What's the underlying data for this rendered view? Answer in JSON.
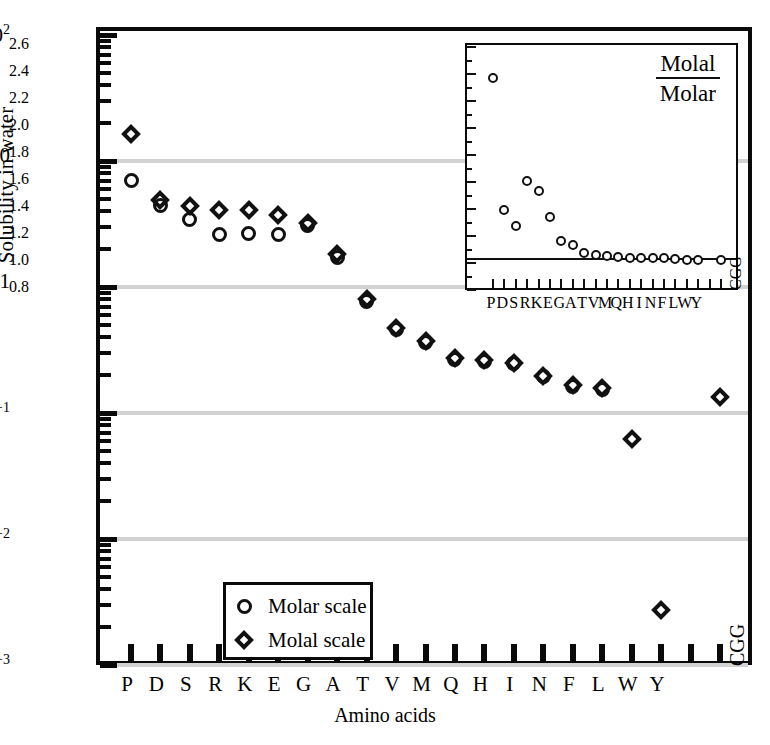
{
  "chart_data": {
    "type": "scatter",
    "title": "",
    "xlabel": "Amino acids",
    "ylabel": "Solubility in water",
    "log_y": true,
    "ylim": [
      0.001,
      100
    ],
    "y_tick_labels": [
      "10²",
      "10",
      "1",
      "10⁻¹",
      "10⁻²",
      "10⁻³"
    ],
    "y_tick_values": [
      100,
      10,
      1,
      0.1,
      0.01,
      0.001
    ],
    "grid": "horizontal-gray-at-decades",
    "categories": [
      "P",
      "D",
      "S",
      "R",
      "K",
      "E",
      "G",
      "A",
      "T",
      "V",
      "M",
      "Q",
      "H",
      "I",
      "N",
      "F",
      "L",
      "W",
      "Y",
      "",
      "CGG"
    ],
    "legend_position": "lower-left",
    "series": [
      {
        "name": "Molar scale",
        "marker": "circle",
        "values": [
          7.0,
          4.4,
          3.45,
          2.6,
          2.65,
          2.6,
          3.05,
          1.72,
          0.77,
          0.46,
          0.365,
          0.265,
          0.258,
          0.245,
          0.195,
          0.163,
          0.155,
          null,
          null,
          null,
          null
        ]
      },
      {
        "name": "Molal scale",
        "marker": "diamond",
        "values": [
          16.5,
          4.9,
          4.4,
          4.1,
          4.05,
          3.75,
          3.2,
          1.82,
          0.8,
          0.475,
          0.372,
          0.272,
          0.265,
          0.248,
          0.198,
          0.166,
          0.157,
          0.0625,
          0.00275,
          null,
          0.135
        ]
      }
    ],
    "inset": {
      "type": "scatter",
      "ratio_numerator": "Molal",
      "ratio_denominator": "Molar",
      "ylim": [
        0.8,
        2.6
      ],
      "y_tick_labels": [
        "0.8",
        "1.0",
        "1.2",
        "1.4",
        "1.6",
        "1.8",
        "2.0",
        "2.2",
        "2.4",
        "2.6"
      ],
      "y_tick_values": [
        0.8,
        1.0,
        1.2,
        1.4,
        1.6,
        1.8,
        2.0,
        2.2,
        2.4,
        2.6
      ],
      "baseline": 1.03,
      "categories": [
        "P",
        "D",
        "S",
        "R",
        "K",
        "E",
        "G",
        "A",
        "T",
        "V",
        "M",
        "Q",
        "H",
        "I",
        "N",
        "F",
        "L",
        "W",
        "Y",
        "",
        "CGG"
      ],
      "values": [
        2.37,
        1.39,
        1.275,
        1.605,
        1.53,
        1.34,
        1.16,
        1.13,
        1.075,
        1.06,
        1.05,
        1.045,
        1.04,
        1.04,
        1.035,
        1.035,
        1.03,
        1.025,
        1.02,
        null,
        1.025
      ]
    }
  },
  "axes": {
    "y_title": "Solubility in water",
    "x_title": "Amino acids",
    "y_ticks": [
      {
        "label_html": "10<sup>2</sup>",
        "value": 100
      },
      {
        "label_html": "10",
        "value": 10
      },
      {
        "label_html": "1",
        "value": 1
      },
      {
        "label_html": "10<sup>−1</sup>",
        "value": 0.1
      },
      {
        "label_html": "10<sup>−2</sup>",
        "value": 0.01
      },
      {
        "label_html": "10<sup>−3</sup>",
        "value": 0.001
      }
    ]
  },
  "legend": {
    "items": [
      {
        "marker": "circle",
        "label": "Molar scale"
      },
      {
        "marker": "diamond",
        "label": "Molal scale"
      }
    ]
  },
  "inset_labels": {
    "numerator": "Molal",
    "denominator": "Molar"
  },
  "colors": {
    "frame": "#0a0a0a",
    "gridline": "#d2d2d2",
    "marker": "#111111",
    "background": "#ffffff"
  }
}
